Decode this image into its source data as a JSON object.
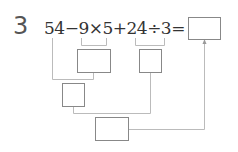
{
  "problem": {
    "number": "3",
    "expression": "54−9×5+24÷3=",
    "answer_box": "",
    "steps": [
      {
        "id": "step-9x5",
        "label": "9×5",
        "value": ""
      },
      {
        "id": "step-24div3",
        "label": "24÷3",
        "value": ""
      },
      {
        "id": "step-54minus",
        "label": "54−(9×5)",
        "value": ""
      },
      {
        "id": "step-final",
        "label": "(54−9×5)+(24÷3)",
        "value": ""
      }
    ]
  },
  "colors": {
    "line": "#bbbbbb",
    "box_border": "#888888",
    "text": "#333333"
  }
}
